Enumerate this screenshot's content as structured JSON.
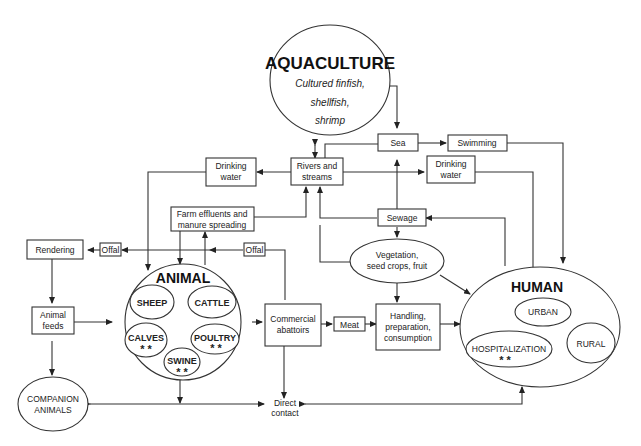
{
  "diagram": {
    "aquaculture": {
      "title": "AQUACULTURE",
      "line1": "Cultured finfish,",
      "line2": "shellfish,",
      "line3": "shrimp"
    },
    "sea": "Sea",
    "swimming": "Swimming",
    "rivers": {
      "line1": "Rivers and",
      "line2": "streams"
    },
    "drinking_water_left": {
      "line1": "Drinking",
      "line2": "water"
    },
    "drinking_water_right": {
      "line1": "Drinking",
      "line2": "water"
    },
    "sewage": "Sewage",
    "farm_effluents": {
      "line1": "Farm effluents and",
      "line2": "manure spreading"
    },
    "rendering": "Rendering",
    "offal_left": "Offal",
    "offal_right": "Offal",
    "animal_feeds": {
      "line1": "Animal",
      "line2": "feeds"
    },
    "vegetation": {
      "line1": "Vegetation,",
      "line2": "seed crops, fruit"
    },
    "animal": {
      "title": "ANIMAL",
      "sheep": "SHEEP",
      "cattle": "CATTLE",
      "calves": "CALVES",
      "poultry": "POULTRY",
      "swine": "SWINE",
      "marker": "* *"
    },
    "abattoirs": {
      "line1": "Commercial",
      "line2": "abattoirs"
    },
    "meat": "Meat",
    "handling": {
      "line1": "Handling,",
      "line2": "preparation,",
      "line3": "consumption"
    },
    "human": {
      "title": "HUMAN",
      "urban": "URBAN",
      "rural": "RURAL",
      "hospitalization": "HOSPITALIZATION",
      "marker": "* *"
    },
    "companion": {
      "line1": "COMPANION",
      "line2": "ANIMALS"
    },
    "direct_contact": {
      "line1": "Direct",
      "line2": "contact"
    }
  }
}
